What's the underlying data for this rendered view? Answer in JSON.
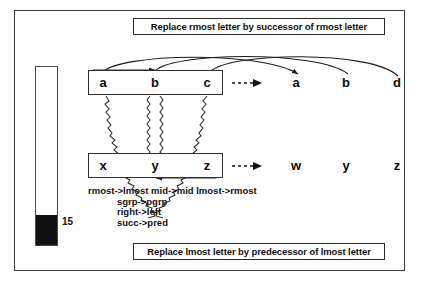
{
  "figure": {
    "banner_top": "Replace rmost letter by successor of rmost letter",
    "banner_bottom": "Replace lmost letter by predecessor of lmost letter"
  },
  "gauge": {
    "name": "activation-gauge",
    "value_label": "15",
    "fill_percent": 17
  },
  "source_string": {
    "letters": [
      "a",
      "b",
      "c"
    ]
  },
  "result_top": {
    "letters": [
      "a",
      "b",
      "d"
    ]
  },
  "target_string": {
    "letters": [
      "x",
      "y",
      "z"
    ]
  },
  "result_bottom": {
    "letters": [
      "w",
      "y",
      "z"
    ]
  },
  "arrows": {
    "top_transform": "dashed-arrow-right",
    "bottom_transform": "dashed-arrow-right"
  },
  "rules": {
    "line1": "rmost->lmost  mid->mid  lmost->rmost",
    "line2": "sgrp->pgrp",
    "line3": "right->left",
    "line4": "succ->pred"
  },
  "colors": {
    "ink": "#111111",
    "frame": "#3a3a3a",
    "fill": "#111111",
    "paper": "#ffffff"
  }
}
